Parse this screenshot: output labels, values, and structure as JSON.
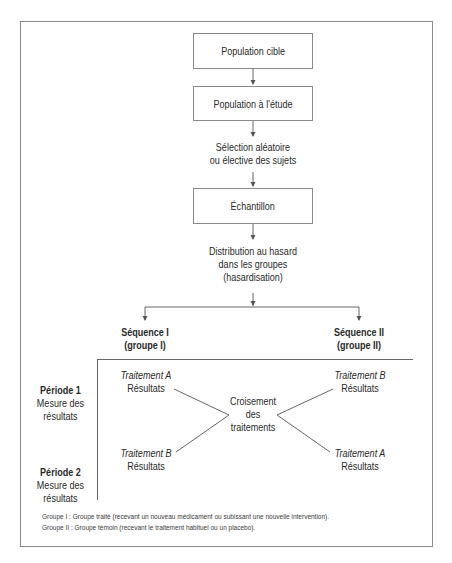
{
  "flow": {
    "box1": "Population cible",
    "box2": "Population à l'étude",
    "selection": {
      "line1": "Sélection aléatoire",
      "line2": "ou élective des sujets"
    },
    "box3": "Échantillon",
    "distribution": {
      "line1": "Distribution au hasard",
      "line2": "dans les groupes",
      "line3": "(hasardisation)"
    }
  },
  "sequences": {
    "left": {
      "title": "Séquence I",
      "group": "(groupe I)"
    },
    "right": {
      "title": "Séquence II",
      "group": "(groupe II)"
    }
  },
  "periods": [
    {
      "title": "Période 1",
      "line1": "Mesure des",
      "line2": "résultats"
    },
    {
      "title": "Période 2",
      "line1": "Mesure des",
      "line2": "résultats"
    }
  ],
  "cells": {
    "p1_left": {
      "treatment": "Traitement A",
      "result": "Résultats"
    },
    "p1_right": {
      "treatment": "Traitement B",
      "result": "Résultats"
    },
    "p2_left": {
      "treatment": "Traitement B",
      "result": "Résultats"
    },
    "p2_right": {
      "treatment": "Traitement A",
      "result": "Résultats"
    }
  },
  "crossover": {
    "line1": "Croisement",
    "line2": "des",
    "line3": "traitements"
  },
  "footnotes": [
    {
      "key": "Groupe I :",
      "text": "Groupe traité (recevant un nouveau médicament ou subissant une nouvelle intervention)."
    },
    {
      "key": "Groupe II :",
      "text": "Groupe témoin (recevant le traitement habituel ou un placebo)."
    }
  ],
  "colors": {
    "line": "#8a8a8a",
    "text": "#2a2a2a"
  }
}
